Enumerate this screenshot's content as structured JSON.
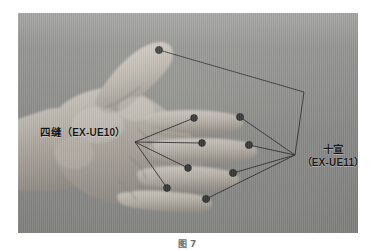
{
  "figure": {
    "caption": "图 7",
    "photo": {
      "background_color": "#8e8e8e",
      "skin_color": "#b9b4ab",
      "marker_color": "#3b3b3b",
      "leader_line_color": "#2e2e2e",
      "width_px": 340,
      "height_px": 220
    }
  },
  "labels": {
    "sifeng": {
      "name_cn": "四缝",
      "code": "（EX-UE10）",
      "open_paren": "（",
      "close_paren": "）",
      "code_plain": "EX-UE10"
    },
    "shixuan": {
      "name_cn": "十宣",
      "code": "（EX-UE11）",
      "open_paren": "（",
      "close_paren": "）",
      "code_plain": "EX-UE11"
    }
  },
  "acupoints": {
    "sifeng_points": [
      {
        "label": "index-finger-sifeng",
        "x": 194,
        "y": 118
      },
      {
        "label": "middle-finger-sifeng",
        "x": 202,
        "y": 143
      },
      {
        "label": "ring-finger-sifeng",
        "x": 188,
        "y": 168
      },
      {
        "label": "little-finger-sifeng",
        "x": 167,
        "y": 188
      }
    ],
    "shixuan_points": [
      {
        "label": "thumb-tip-shixuan",
        "x": 159,
        "y": 50
      },
      {
        "label": "index-finger-tip-shixuan",
        "x": 240,
        "y": 117
      },
      {
        "label": "middle-finger-tip-shixuan",
        "x": 249,
        "y": 145
      },
      {
        "label": "ring-finger-tip-shixuan",
        "x": 233,
        "y": 173
      },
      {
        "label": "little-finger-tip-shixuan",
        "x": 206,
        "y": 199
      }
    ],
    "sifeng_leader_origin": {
      "x": 135,
      "y": 142
    },
    "shixuan_leader_origin": {
      "x": 295,
      "y": 155
    }
  }
}
